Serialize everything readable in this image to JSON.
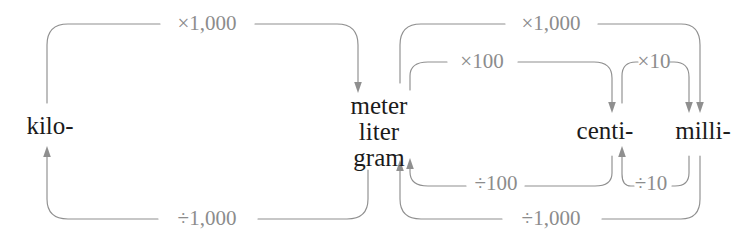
{
  "diagram": {
    "type": "metric-prefix-conversion-chart",
    "background_color": "#ffffff",
    "line_color": "#8f8f8f",
    "operator_label_color": "#8c8c8c",
    "unit_label_color": "#1b1b1b",
    "nodes": [
      {
        "id": "kilo",
        "label": "kilo-",
        "x": 50,
        "y": 125
      },
      {
        "id": "base1",
        "label": "meter",
        "x": 379,
        "y": 105
      },
      {
        "id": "base2",
        "label": "liter",
        "x": 379,
        "y": 131
      },
      {
        "id": "base3",
        "label": "gram",
        "x": 379,
        "y": 157
      },
      {
        "id": "centi",
        "label": "centi-",
        "x": 605,
        "y": 130
      },
      {
        "id": "milli",
        "label": "milli-",
        "x": 703,
        "y": 130
      }
    ],
    "edges": [
      {
        "id": "kilo-to-base",
        "from": "kilo",
        "to": "base",
        "operator": "×1,000",
        "label_x": 207,
        "label_y": 30,
        "side": "top",
        "direction": "right"
      },
      {
        "id": "base-to-kilo",
        "from": "base",
        "to": "kilo",
        "operator": "÷1,000",
        "label_x": 207,
        "label_y": 225,
        "side": "bottom",
        "direction": "left"
      },
      {
        "id": "base-to-milli",
        "from": "base",
        "to": "milli",
        "operator": "×1,000",
        "label_x": 551,
        "label_y": 30,
        "side": "top",
        "direction": "right"
      },
      {
        "id": "base-to-centi",
        "from": "base",
        "to": "centi",
        "operator": "×100",
        "label_x": 482,
        "label_y": 68,
        "side": "top",
        "direction": "right"
      },
      {
        "id": "centi-to-milli",
        "from": "centi",
        "to": "milli",
        "operator": "×10",
        "label_x": 654,
        "label_y": 68,
        "side": "top",
        "direction": "right"
      },
      {
        "id": "centi-to-base",
        "from": "centi",
        "to": "base",
        "operator": "÷100",
        "label_x": 496,
        "label_y": 190,
        "side": "bottom",
        "direction": "left"
      },
      {
        "id": "milli-to-centi",
        "from": "milli",
        "to": "centi",
        "operator": "÷10",
        "label_x": 651,
        "label_y": 190,
        "side": "bottom",
        "direction": "left"
      },
      {
        "id": "milli-to-base",
        "from": "milli",
        "to": "base",
        "operator": "÷1,000",
        "label_x": 551,
        "label_y": 225,
        "side": "bottom",
        "direction": "left"
      }
    ]
  }
}
